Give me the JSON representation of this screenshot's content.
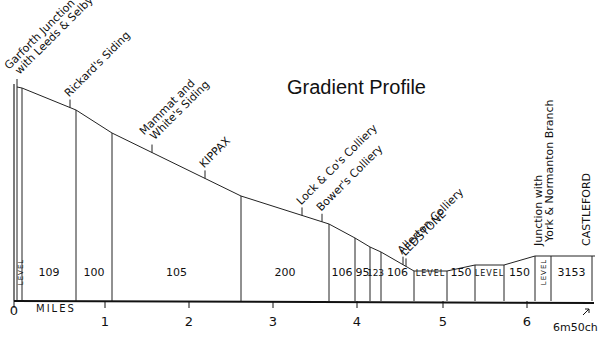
{
  "title": "Gradient Profile",
  "axis": {
    "label": "MILES",
    "ticks": [
      {
        "label": "0",
        "x": 14
      },
      {
        "label": "1",
        "x": 105
      },
      {
        "label": "2",
        "x": 189
      },
      {
        "label": "3",
        "x": 273
      },
      {
        "label": "4",
        "x": 357
      },
      {
        "label": "5",
        "x": 443
      },
      {
        "label": "6",
        "x": 527
      }
    ],
    "end_label": "6m50ch"
  },
  "stations": [
    {
      "label": "Garforth Junction",
      "label2": "with Leeds & Selby",
      "x": 17
    },
    {
      "label": "Rickard's Siding",
      "x": 70
    },
    {
      "label": "Mammat and",
      "label2": "White's Siding",
      "x": 152
    },
    {
      "label": "KIPPAX",
      "x": 205
    },
    {
      "label": "Lock & Co's Colliery",
      "x": 302
    },
    {
      "label": "Bower's Colliery",
      "x": 322
    },
    {
      "label": "Allerton Colliery",
      "x": 403
    },
    {
      "label": "LEDSTONE",
      "x": 406
    },
    {
      "label": "Junction with",
      "label2": "York & Normanton Branch",
      "x": 553
    },
    {
      "label": "CASTLEFORD",
      "x": 591
    }
  ],
  "gradients": [
    {
      "label": "LEVEL",
      "x1": 17,
      "x2": 22,
      "vertical": true
    },
    {
      "label": "109",
      "x1": 22,
      "x2": 76
    },
    {
      "label": "100",
      "x1": 76,
      "x2": 112
    },
    {
      "label": "105",
      "x1": 112,
      "x2": 241
    },
    {
      "label": "200",
      "x1": 241,
      "x2": 329
    },
    {
      "label": "106",
      "x1": 329,
      "x2": 355
    },
    {
      "label": "95",
      "x1": 355,
      "x2": 370
    },
    {
      "label": "123",
      "x1": 370,
      "x2": 381
    },
    {
      "label": "106",
      "x1": 381,
      "x2": 414
    },
    {
      "label": "LEVEL",
      "x1": 414,
      "x2": 447
    },
    {
      "label": "150",
      "x1": 447,
      "x2": 475
    },
    {
      "label": "LEVEL",
      "x1": 475,
      "x2": 504
    },
    {
      "label": "150",
      "x1": 504,
      "x2": 535
    },
    {
      "label": "LEVEL",
      "x1": 535,
      "x2": 551,
      "vertical": true
    },
    {
      "label": "3153",
      "x1": 551,
      "x2": 592
    }
  ],
  "profile_points": [
    [
      17,
      87
    ],
    [
      22,
      88
    ],
    [
      76,
      110
    ],
    [
      112,
      133
    ],
    [
      241,
      196
    ],
    [
      329,
      224
    ],
    [
      355,
      238
    ],
    [
      370,
      247
    ],
    [
      381,
      252
    ],
    [
      414,
      271
    ],
    [
      447,
      271
    ],
    [
      475,
      265
    ],
    [
      504,
      265
    ],
    [
      535,
      256
    ],
    [
      595,
      256
    ]
  ]
}
